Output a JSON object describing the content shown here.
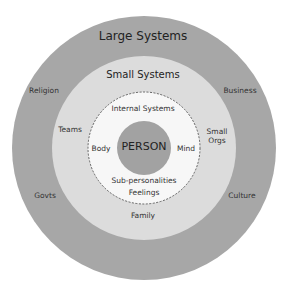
{
  "colors": {
    "outer": "#a7a7a7",
    "middle": "#dcdcdc",
    "inner": "#f7f7f7",
    "person": "#a2a2a2",
    "dash": "#555555"
  },
  "rings": {
    "large": {
      "title": "Large Systems",
      "items": [
        "Religion",
        "Business",
        "Govts",
        "Culture"
      ]
    },
    "small": {
      "title": "Small Systems",
      "items": [
        "Teams",
        "Small Orgs",
        "Family"
      ]
    },
    "internal": {
      "title": "Internal Systems",
      "items": [
        "Body",
        "Mind",
        "Sub-personalities",
        "Feelings"
      ]
    },
    "center": {
      "label": "PERSON"
    }
  }
}
